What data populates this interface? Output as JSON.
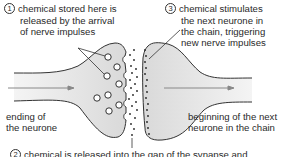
{
  "diagram": {
    "type": "synapse",
    "labels": {
      "step1": {
        "number": "1",
        "text_lines": [
          "chemical stored here is",
          "released by the arrival",
          "of nerve impulses"
        ]
      },
      "step2": {
        "number": "2",
        "text_lines": [
          "chemical is released into the gap of the synapse and"
        ]
      },
      "step3": {
        "number": "3",
        "text_lines": [
          "chemical stimulates",
          "the next neurone in",
          "the chain, triggering",
          "new nerve impulses"
        ]
      },
      "left_neurone": {
        "text_lines": [
          "ending of",
          "the neurone"
        ]
      },
      "right_neurone": {
        "text_lines": [
          "beginning of the next",
          "neurone in the chain"
        ]
      }
    },
    "colors": {
      "neurone_fill": "#e4e4e4",
      "outline": "#333333",
      "arrow": "#888888"
    }
  }
}
